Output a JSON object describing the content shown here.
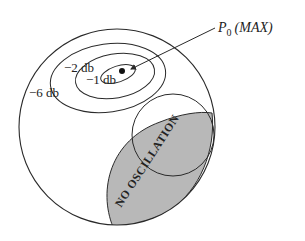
{
  "diagram": {
    "title_label": "P",
    "title_subscript": "0",
    "title_suffix": "(MAX)",
    "contours": [
      {
        "label": "−6 db"
      },
      {
        "label": "−2 db"
      },
      {
        "label": "−1 db"
      }
    ],
    "region_label": "NO OSCILLATION",
    "colors": {
      "stroke": "#2a2a2a",
      "region_fill": "#b8b8b8",
      "background": "#ffffff"
    }
  }
}
